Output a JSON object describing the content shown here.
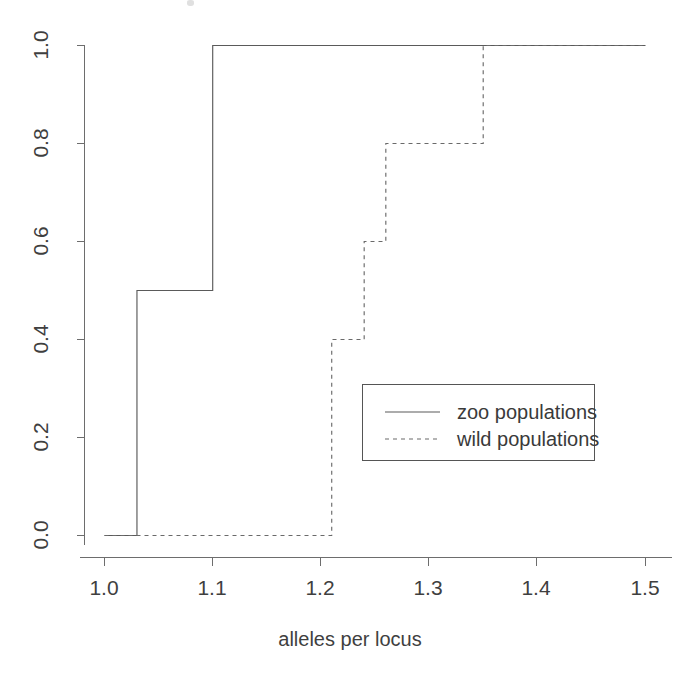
{
  "chart_data": {
    "type": "line",
    "subtype": "empirical-cumulative-distribution-step",
    "title": "",
    "xlabel": "alleles per locus",
    "ylabel": "",
    "xlim": [
      1.0,
      1.5
    ],
    "ylim": [
      0.0,
      1.0
    ],
    "grid": false,
    "legend_position": "center-right",
    "xticks": [
      1.0,
      1.1,
      1.2,
      1.3,
      1.4,
      1.5
    ],
    "xtick_labels": [
      "1.0",
      "1.1",
      "1.2",
      "1.3",
      "1.4",
      "1.5"
    ],
    "yticks": [
      0.0,
      0.2,
      0.4,
      0.6,
      0.8,
      1.0
    ],
    "ytick_labels": [
      "0.0",
      "0.2",
      "0.4",
      "0.6",
      "0.8",
      "1.0"
    ],
    "series": [
      {
        "name": "zoo populations",
        "style": "solid",
        "color": "#5a5a5a",
        "steps_x": [
          1.0,
          1.03,
          1.03,
          1.1,
          1.1,
          1.5
        ],
        "steps_y": [
          0.0,
          0.0,
          0.5,
          0.5,
          1.0,
          1.0
        ],
        "jump_points": [
          {
            "x": 1.03,
            "from": 0.0,
            "to": 0.5
          },
          {
            "x": 1.1,
            "from": 0.5,
            "to": 1.0
          }
        ]
      },
      {
        "name": "wild populations",
        "style": "dashed",
        "color": "#6a6a6a",
        "steps_x": [
          1.0,
          1.21,
          1.21,
          1.24,
          1.24,
          1.26,
          1.26,
          1.35,
          1.35,
          1.5
        ],
        "steps_y": [
          0.0,
          0.0,
          0.4,
          0.4,
          0.6,
          0.6,
          0.8,
          0.8,
          1.0,
          1.0
        ],
        "jump_points": [
          {
            "x": 1.21,
            "from": 0.0,
            "to": 0.4
          },
          {
            "x": 1.24,
            "from": 0.4,
            "to": 0.6
          },
          {
            "x": 1.26,
            "from": 0.6,
            "to": 0.8
          },
          {
            "x": 1.35,
            "from": 0.8,
            "to": 1.0
          }
        ]
      }
    ]
  },
  "axes": {
    "x_title": "alleles per locus",
    "x_tick_labels": [
      "1.0",
      "1.1",
      "1.2",
      "1.3",
      "1.4",
      "1.5"
    ],
    "y_tick_labels": [
      "0.0",
      "0.2",
      "0.4",
      "0.6",
      "0.8",
      "1.0"
    ]
  },
  "legend": {
    "entries": [
      {
        "label": "zoo populations",
        "style": "solid"
      },
      {
        "label": "wild populations",
        "style": "dashed"
      }
    ]
  },
  "colors": {
    "background": "#ffffff",
    "axis": "#6d6d6d",
    "series_solid": "#5a5a5a",
    "series_dashed": "#6a6a6a",
    "text": "#3f3f3f",
    "legend_border": "#555555"
  }
}
